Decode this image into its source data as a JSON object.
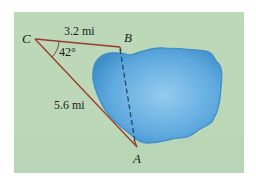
{
  "figure": {
    "background_color": "#bcd8b8",
    "panel": {
      "x": 14,
      "y": 12,
      "w": 230,
      "h": 161
    },
    "lake": {
      "fill": "#5aa6dc",
      "edge": "#3e8cc6",
      "highlight": "#8cc4ea"
    },
    "triangle_color": "#9a3a2a",
    "dashed_color": "#27456a",
    "vertices": {
      "C": {
        "label": "C",
        "x": 35,
        "y": 39
      },
      "B": {
        "label": "B",
        "x": 120,
        "y": 47
      },
      "A": {
        "label": "A",
        "x": 137,
        "y": 148
      }
    },
    "sides": {
      "CB": {
        "label": "3.2 mi"
      },
      "CA": {
        "label": "5.6 mi"
      },
      "AB": {
        "label": "",
        "style": "dashed"
      }
    },
    "angle": {
      "vertex": "C",
      "label": "42°"
    }
  }
}
